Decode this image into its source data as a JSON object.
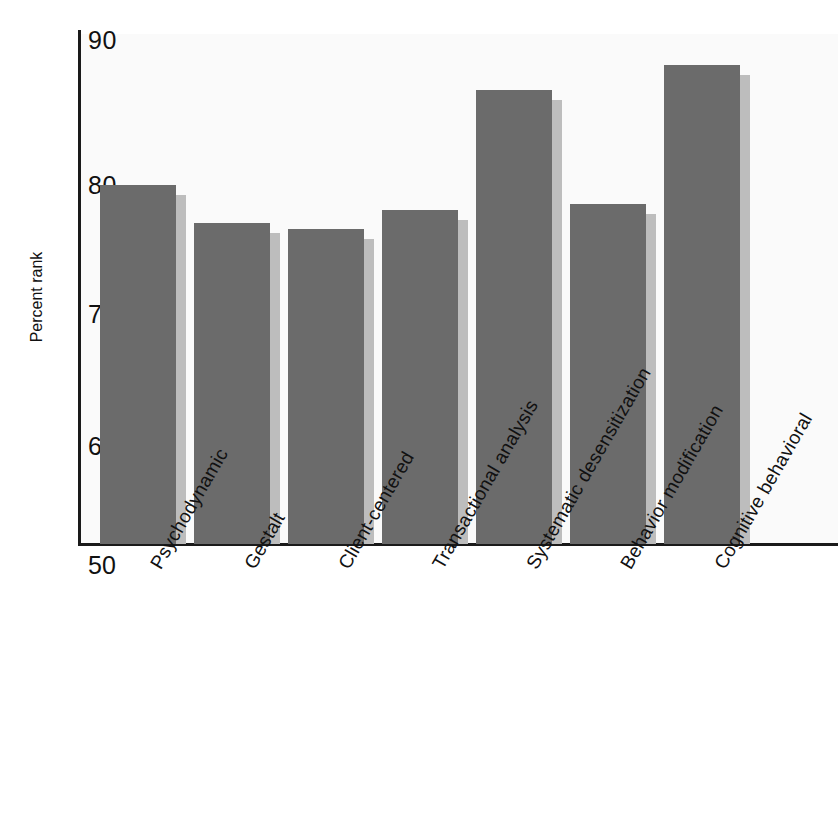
{
  "chart_data": {
    "type": "bar",
    "title": "",
    "xlabel": "",
    "ylabel": "Percent rank",
    "ylim": [
      50,
      90
    ],
    "yticks": [
      90,
      80,
      70,
      60,
      50
    ],
    "grid": false,
    "legend": null,
    "categories": [
      "Psychodynamic",
      "Gestalt",
      "Client-centered",
      "Transactional analysis",
      "Systematic desensitization",
      "Behavior modification",
      "Cognitive behavioral"
    ],
    "values": [
      78.5,
      75.5,
      75,
      76.5,
      86,
      77,
      88
    ],
    "series": [
      {
        "name": "Percent rank",
        "values": [
          78.5,
          75.5,
          75,
          76.5,
          86,
          77,
          88
        ]
      }
    ],
    "colors": {
      "bar_fill": "#6b6b6b",
      "bar_shadow": "#bdbdbd",
      "axis": "#1a1a1a",
      "plot_background": "#fafafa",
      "text": "#111111"
    }
  },
  "axis": {
    "y_tick_labels": [
      "90",
      "80",
      "70",
      "60",
      "50"
    ],
    "y_title": "Percent rank"
  }
}
